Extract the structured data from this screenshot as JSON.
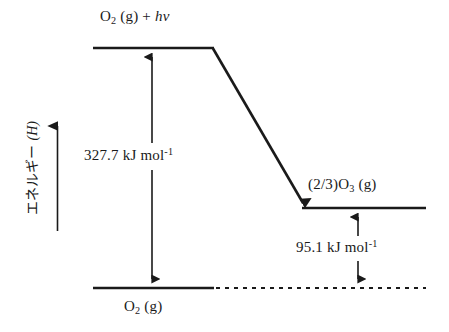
{
  "diagram": {
    "background_color": "#ffffff",
    "stroke_color": "#1a1a1a",
    "axis": {
      "label_prefix": "エネルギー",
      "label_separator": " ",
      "label_variable": "(H)",
      "label_full": "エネルギー (H)",
      "direction": "up",
      "arrow_name": "energy-axis-arrow"
    },
    "levels": [
      {
        "id": "reactant",
        "label_species": "O",
        "label_subscript": "2",
        "label_state": " (g) + ",
        "label_photon": "hv",
        "label_full": "O2 (g) + hv",
        "position": "top-left"
      },
      {
        "id": "ozone",
        "label_prefix": "(2/3)O",
        "label_subscript": "3",
        "label_state": " (g)",
        "label_full": "(2/3)O3 (g)",
        "position": "middle-right"
      },
      {
        "id": "product",
        "label_species": "O",
        "label_subscript": "2",
        "label_state": " (g)",
        "label_full": "O2 (g)",
        "position": "bottom-left"
      }
    ],
    "measurements": [
      {
        "id": "excitation",
        "value": "327.7",
        "unit_main": " kJ mol",
        "unit_exponent": "-1",
        "text_full": "327.7 kJ mol-1",
        "arrow_style": "double-headed-vertical"
      },
      {
        "id": "ozone-formation",
        "value": "95.1",
        "unit_main": " kJ mol",
        "unit_exponent": "-1",
        "text_full": "95.1 kJ mol-1",
        "arrow_style": "double-headed-vertical"
      }
    ],
    "transition_arrow": {
      "id": "relaxation-arrow",
      "from": "reactant",
      "to": "ozone",
      "style": "solid-diagonal-arrowhead"
    },
    "baseline_extension": {
      "id": "dashed-baseline",
      "style": "dashed"
    }
  }
}
